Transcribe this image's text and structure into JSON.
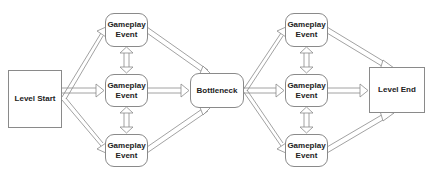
{
  "diagram": {
    "nodes": [
      {
        "id": "level-start",
        "label": "Level Start",
        "shape": "rect"
      },
      {
        "id": "event-1a",
        "label": "Gameplay Event",
        "shape": "rounded"
      },
      {
        "id": "event-1b",
        "label": "Gameplay Event",
        "shape": "rounded"
      },
      {
        "id": "event-1c",
        "label": "Gameplay Event",
        "shape": "rounded"
      },
      {
        "id": "bottleneck",
        "label": "Bottleneck",
        "shape": "rounded"
      },
      {
        "id": "event-2a",
        "label": "Gameplay Event",
        "shape": "rounded"
      },
      {
        "id": "event-2b",
        "label": "Gameplay Event",
        "shape": "rounded"
      },
      {
        "id": "event-2c",
        "label": "Gameplay Event",
        "shape": "rounded"
      },
      {
        "id": "level-end",
        "label": "Level End",
        "shape": "rect"
      }
    ],
    "edges": [
      {
        "from": "level-start",
        "to": "event-1a"
      },
      {
        "from": "level-start",
        "to": "event-1b"
      },
      {
        "from": "level-start",
        "to": "event-1c"
      },
      {
        "from": "event-1a",
        "to": "event-1b",
        "bidirectional": true
      },
      {
        "from": "event-1b",
        "to": "event-1c",
        "bidirectional": true
      },
      {
        "from": "event-1a",
        "to": "bottleneck"
      },
      {
        "from": "event-1b",
        "to": "bottleneck"
      },
      {
        "from": "event-1c",
        "to": "bottleneck"
      },
      {
        "from": "bottleneck",
        "to": "event-2a"
      },
      {
        "from": "bottleneck",
        "to": "event-2b"
      },
      {
        "from": "bottleneck",
        "to": "event-2c"
      },
      {
        "from": "event-2a",
        "to": "event-2b",
        "bidirectional": true
      },
      {
        "from": "event-2b",
        "to": "event-2c",
        "bidirectional": true
      },
      {
        "from": "event-2a",
        "to": "level-end"
      },
      {
        "from": "event-2b",
        "to": "level-end"
      },
      {
        "from": "event-2c",
        "to": "level-end"
      }
    ],
    "colors": {
      "stroke": "#8a8a8a",
      "text": "#222222",
      "fill": "#ffffff"
    }
  }
}
